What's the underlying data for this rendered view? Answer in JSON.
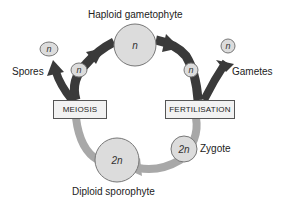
{
  "title": "Haploid gametophyte",
  "labels": {
    "top": "Haploid gametophyte",
    "spores": "Spores",
    "gametes": "Gametes",
    "zygote": "Zygote",
    "bottom": "Diploid sporophyte"
  },
  "boxes": {
    "meiosis": "MEIOSIS",
    "fertilisation": "FERTILISATION"
  },
  "nodes": {
    "gametophyte": "n",
    "spore_free": "n",
    "spore_arc": "n",
    "gamete_arc": "n",
    "gamete_free": "n",
    "sporophyte": "2n",
    "zygote": "2n"
  },
  "colors": {
    "haploid_arrow": "#3a3a3a",
    "diploid_arrow": "#a8a8a8",
    "node_fill": "#dcdcdc",
    "node_stroke": "#777777",
    "box_fill": "#f2f2f2"
  }
}
